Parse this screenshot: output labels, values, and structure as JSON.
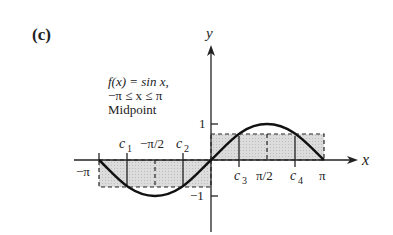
{
  "figure": {
    "panel_label": "(c)",
    "function_label": "f(x) = sin x,",
    "domain_label": "−π ≤ x ≤ π",
    "method_label": "Midpoint",
    "axis_x_label": "x",
    "axis_y_label": "y",
    "x_ticks": [
      "−π",
      "c",
      "−π/2",
      "c",
      "c",
      "π/2",
      "c",
      "π"
    ],
    "x_tick_labels": {
      "neg_pi": "−π",
      "c1": "c",
      "c1_sub": "1",
      "neg_pi_half": "−π/2",
      "c2": "c",
      "c2_sub": "2",
      "c3": "c",
      "c3_sub": "3",
      "pi_half": "π/2",
      "c4": "c",
      "c4_sub": "4",
      "pi": "π"
    },
    "y_tick_labels": {
      "one": "1",
      "neg_one": "−1"
    },
    "colors": {
      "curve": "#111111",
      "fill": "#d4d4d4",
      "axis": "#222222"
    }
  }
}
